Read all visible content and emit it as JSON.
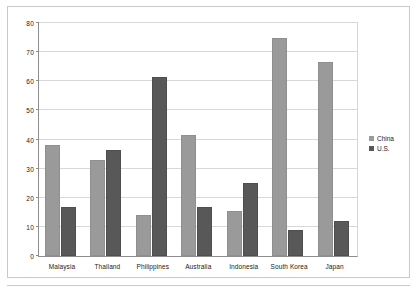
{
  "chart_data": {
    "type": "bar",
    "title": "",
    "subtitle": "",
    "xlabel": "",
    "ylabel": "",
    "ylim": [
      0,
      80
    ],
    "ytick_step": 10,
    "yticks": [
      "0",
      "10",
      "20",
      "30",
      "40",
      "50",
      "60",
      "70",
      "80"
    ],
    "grid": true,
    "legend_position": "right",
    "categories": [
      "Malaysia",
      "Thailand",
      "Philippines",
      "Australia",
      "Indonesia",
      "South Korea",
      "Japan"
    ],
    "series": [
      {
        "name": "China",
        "color": "#9a9a9a",
        "values": [
          38,
          33,
          14,
          41.5,
          15.5,
          75,
          66.5
        ]
      },
      {
        "name": "U.S.",
        "color": "#585858",
        "values": [
          17,
          36.5,
          61.5,
          17,
          25,
          9,
          12
        ]
      }
    ]
  },
  "legend": {
    "entries": [
      {
        "label": "China"
      },
      {
        "label": "U.S."
      }
    ]
  },
  "colors": {
    "series_china": "#9a9a9a",
    "series_us": "#585858",
    "gridline": "#d8d8d8",
    "axis": "#8d8d8d",
    "frame": "#c9c9c9",
    "background": "#ffffff",
    "text": "#1a1a1a"
  }
}
